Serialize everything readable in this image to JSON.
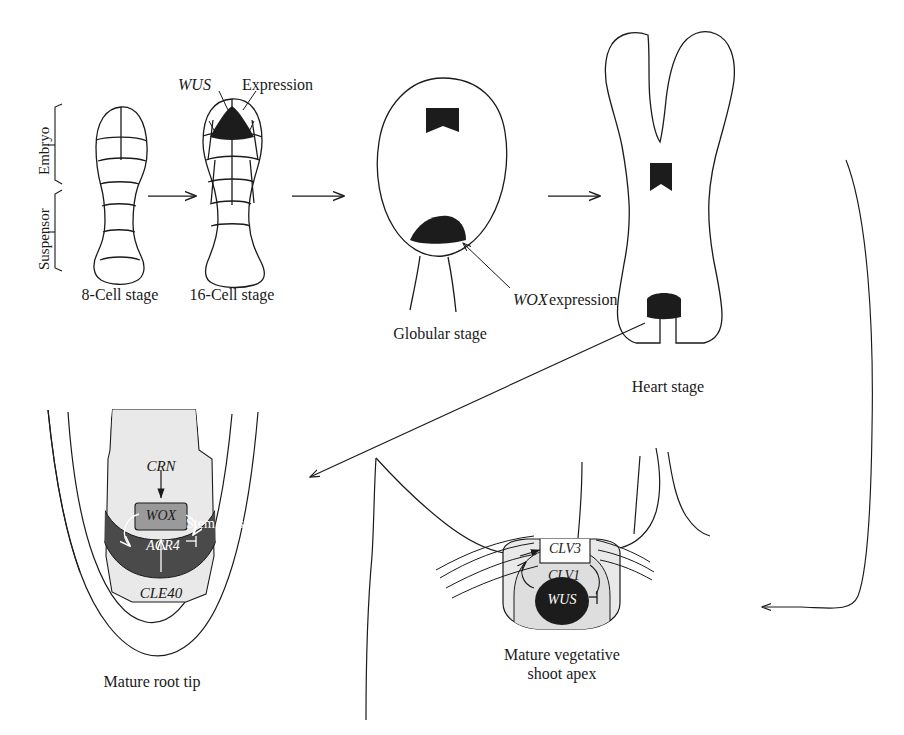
{
  "figure": {
    "title_visible": false,
    "stages": [
      {
        "id": "eight-cell",
        "caption": "8-Cell stage"
      },
      {
        "id": "sixteen-cell",
        "caption": "16-Cell stage"
      },
      {
        "id": "globular",
        "caption": "Globular stage"
      },
      {
        "id": "heart",
        "caption": "Heart stage"
      },
      {
        "id": "root-tip",
        "caption": "Mature root tip"
      },
      {
        "id": "shoot-apex",
        "caption_line1": "Mature vegetative",
        "caption_line2": "shoot apex"
      }
    ],
    "axis_labels": {
      "embryo": "Embryo",
      "suspensor": "Suspensor"
    },
    "annotations": {
      "wus_gene": "WUS",
      "expression": "Expression",
      "wox_expression_gene": "WOX",
      "wox_expression_word": "expression"
    },
    "root_tip_labels": {
      "crn": "CRN",
      "wox": "WOX",
      "acr4": "ACR4",
      "cle40": "CLE40",
      "stem_cells": "Stem cells"
    },
    "shoot_apex_labels": {
      "clv3": "CLV3",
      "clv1": "CLV1",
      "wus": "WUS"
    },
    "colors": {
      "outline": "#1a1a1a",
      "expression_dark": "#1c1c1c",
      "shade_light": "#e9e9e9",
      "shade_mid": "#d8d8d8",
      "shade_dark": "#4a4a4a",
      "text": "#1a1a1a",
      "text_inverse": "#ffffff",
      "background": "#ffffff"
    },
    "arrows": [
      {
        "id": "arrow-8-to-16",
        "from": "eight-cell",
        "to": "sixteen-cell",
        "style": "straight-horizontal"
      },
      {
        "id": "arrow-16-to-globular",
        "from": "sixteen-cell",
        "to": "globular",
        "style": "straight-horizontal"
      },
      {
        "id": "arrow-globular-to-heart",
        "from": "globular",
        "to": "heart",
        "style": "straight-horizontal"
      },
      {
        "id": "arrow-heart-to-root",
        "from": "heart",
        "to": "root-tip",
        "style": "long-diagonal"
      },
      {
        "id": "arrow-heart-to-shoot",
        "from": "heart",
        "to": "shoot-apex",
        "style": "curved-loop-right"
      }
    ]
  }
}
